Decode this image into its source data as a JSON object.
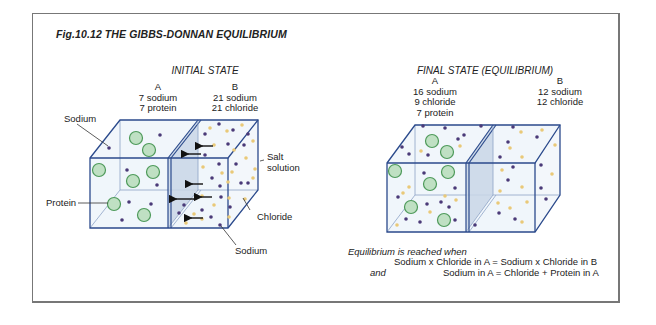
{
  "figure": {
    "title": "Fig.10.12  THE GIBBS-DONNAN EQUILIBRIUM"
  },
  "initial_state": {
    "heading": "INITIAL STATE",
    "compartment_a": {
      "label": "A",
      "lines": [
        "7 sodium",
        "7 protein"
      ]
    },
    "compartment_b": {
      "label": "B",
      "lines": [
        "21 sodium",
        "21 chloride"
      ]
    },
    "callouts": {
      "sodium_top": "Sodium",
      "protein": "Protein",
      "salt_solution_1": "Salt",
      "salt_solution_2": "solution",
      "chloride": "Chloride",
      "sodium_bottom": "Sodium"
    }
  },
  "final_state": {
    "heading": "FINAL STATE (EQUILIBRIUM)",
    "compartment_a": {
      "label": "A",
      "lines": [
        "16 sodium",
        "9 chloride",
        "7 protein"
      ]
    },
    "compartment_b": {
      "label": "B",
      "lines": [
        "12 sodium",
        "12 chloride"
      ]
    }
  },
  "equilibrium_note": {
    "intro": "Equilibrium is reached when",
    "condition_1": "Sodium x Chloride in A = Sodium x Chloride in B",
    "connector": "and",
    "condition_2": "Sodium in A = Chloride + Protein in A"
  },
  "colors": {
    "frame": "#777777",
    "cube_edge": "#2b4a8c",
    "cube_fill": "#eef4fa",
    "partition_fill": "#c9d6e6",
    "protein_fill": "#bfe0c3",
    "protein_edge": "#4e9a5a",
    "sodium_dot": "#4a3a78",
    "chloride_dot": "#e9c978",
    "arrow": "#111111"
  }
}
